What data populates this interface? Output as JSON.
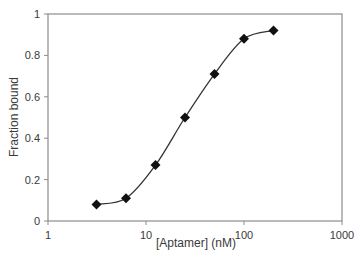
{
  "chart_data": {
    "type": "scatter",
    "title": "",
    "xlabel": "[Aptamer] (nM)",
    "ylabel": "Fraction bound",
    "xscale": "log",
    "xlim": [
      1,
      1000
    ],
    "ylim": [
      0,
      1
    ],
    "xticks": [
      1,
      10,
      100,
      1000
    ],
    "xtick_labels": [
      "1",
      "10",
      "100",
      "1000"
    ],
    "yticks": [
      0,
      0.2,
      0.4,
      0.6,
      0.8,
      1
    ],
    "ytick_labels": [
      "0",
      "0.2",
      "0.4",
      "0.6",
      "0.8",
      "1"
    ],
    "grid": false,
    "legend": null,
    "marker": "diamond",
    "fit_curve": "smooth sigmoidal fit line through points",
    "series": [
      {
        "name": "Fraction bound",
        "x": [
          3.125,
          6.25,
          12.5,
          25,
          50,
          100,
          200
        ],
        "y": [
          0.08,
          0.11,
          0.27,
          0.5,
          0.71,
          0.88,
          0.92
        ]
      }
    ]
  },
  "colors": {
    "axis": "#8c8c8c",
    "marker": "#111111",
    "line": "#333333",
    "text": "#3a3a3a"
  }
}
